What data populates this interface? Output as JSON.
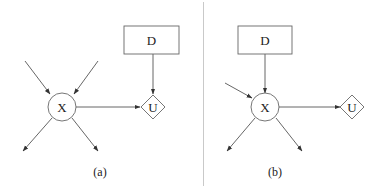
{
  "panels": [
    {
      "caption": "(a)",
      "nodes": {
        "decision": {
          "label": "D",
          "shape": "rectangle"
        },
        "chance": {
          "label": "X",
          "shape": "circle"
        },
        "utility": {
          "label": "U",
          "shape": "diamond"
        }
      },
      "edges": [
        {
          "from": "external",
          "to": "X"
        },
        {
          "from": "external",
          "to": "X"
        },
        {
          "from": "X",
          "to": "external"
        },
        {
          "from": "X",
          "to": "external"
        },
        {
          "from": "X",
          "to": "U"
        },
        {
          "from": "D",
          "to": "U"
        }
      ]
    },
    {
      "caption": "(b)",
      "nodes": {
        "decision": {
          "label": "D",
          "shape": "rectangle"
        },
        "chance": {
          "label": "X",
          "shape": "circle"
        },
        "utility": {
          "label": "U",
          "shape": "diamond"
        }
      },
      "edges": [
        {
          "from": "external",
          "to": "X"
        },
        {
          "from": "D",
          "to": "X"
        },
        {
          "from": "X",
          "to": "external"
        },
        {
          "from": "X",
          "to": "external"
        },
        {
          "from": "X",
          "to": "U"
        }
      ]
    }
  ],
  "colors": {
    "line": "#555555",
    "divider": "#bbbbbb"
  }
}
